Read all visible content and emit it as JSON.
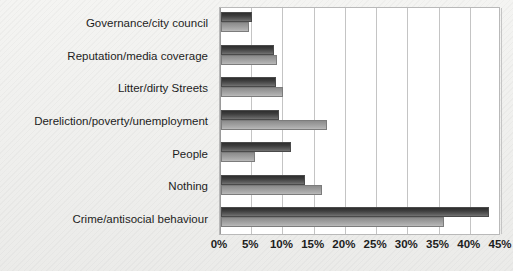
{
  "top_ghost_text": "",
  "chart_data": {
    "type": "bar",
    "orientation": "horizontal",
    "title": "",
    "subtitle": "",
    "xlabel": "",
    "ylabel": "",
    "xlim": [
      0,
      45
    ],
    "xtick_labels": [
      "0%",
      "5%",
      "10%",
      "15%",
      "20%",
      "25%",
      "30%",
      "35%",
      "40%",
      "45%"
    ],
    "xtick_values": [
      0,
      5,
      10,
      15,
      20,
      25,
      30,
      35,
      40,
      45
    ],
    "grid": true,
    "legend": null,
    "legend_position": "none",
    "categories": [
      "Governance/city council",
      "Reputation/media coverage",
      "Litter/dirty Streets",
      "Dereliction/poverty/unemployment",
      "People",
      "Nothing",
      "Crime/antisocial behaviour"
    ],
    "series": [
      {
        "name": "Series 1",
        "color": "#3d3d3d",
        "values": [
          5.0,
          8.5,
          8.8,
          9.3,
          11.2,
          13.4,
          42.9
        ]
      },
      {
        "name": "Series 2",
        "color": "#a0a0a0",
        "values": [
          4.5,
          9.0,
          10.0,
          17.0,
          5.4,
          16.2,
          35.7
        ]
      }
    ]
  }
}
